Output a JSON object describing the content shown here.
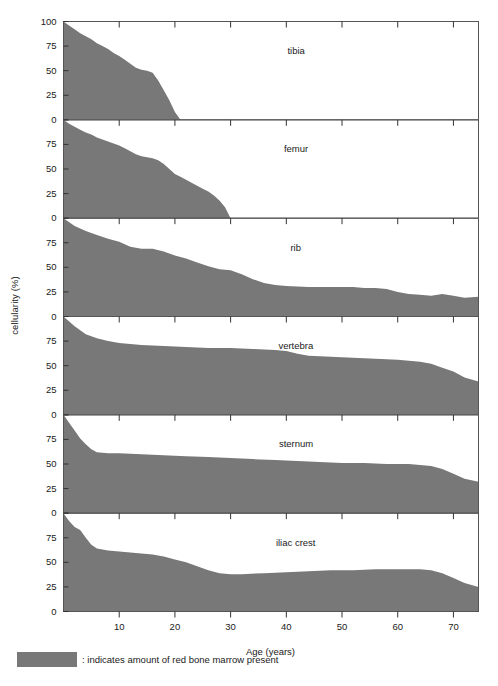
{
  "chart_data": {
    "type": "area",
    "title": "",
    "xlabel": "Age (years)",
    "ylabel": "cellularity (%)",
    "xlim": [
      0,
      74.5
    ],
    "ylim": [
      0,
      100
    ],
    "grid": false,
    "legend_position": "below-axes",
    "legend": [
      {
        "swatch_color": "#787878",
        "text": ": indicates amount of red bone marrow present"
      }
    ],
    "x_ticks": [
      0,
      10,
      20,
      30,
      40,
      50,
      60,
      70
    ],
    "x_tick_labels": [
      "",
      "10",
      "20",
      "30",
      "40",
      "50",
      "60",
      "70"
    ],
    "y_ticks": [
      0,
      25,
      50,
      75,
      100
    ],
    "y_tick_labels_first_panel": [
      "0",
      "25",
      "50",
      "75",
      "100"
    ],
    "y_tick_labels_other_panels": [
      "0",
      "25",
      "50",
      "75",
      ""
    ],
    "fill_color": "#787878",
    "panels": [
      {
        "label": "tibia",
        "x": [
          0,
          1,
          2,
          3,
          4,
          5,
          6,
          7,
          8,
          9,
          10,
          11,
          12,
          13,
          14,
          15,
          16,
          17,
          18,
          19,
          20,
          21,
          74.5
        ],
        "y": [
          100,
          96,
          92,
          88,
          85,
          82,
          78,
          75,
          72,
          68,
          65,
          61,
          57,
          53,
          51,
          50,
          48,
          40,
          30,
          20,
          8,
          0,
          0
        ]
      },
      {
        "label": "femur",
        "x": [
          0,
          1,
          2,
          3,
          4,
          5,
          6,
          7,
          8,
          9,
          10,
          11,
          12,
          13,
          14,
          15,
          16,
          17,
          18,
          19,
          20,
          21,
          22,
          23,
          24,
          25,
          26,
          27,
          28,
          29,
          30,
          74.5
        ],
        "y": [
          100,
          96,
          93,
          90,
          87,
          85,
          82,
          80,
          78,
          76,
          74,
          71,
          68,
          65,
          63,
          62,
          61,
          59,
          55,
          50,
          45,
          42,
          39,
          36,
          33,
          30,
          27,
          23,
          18,
          11,
          0,
          0
        ]
      },
      {
        "label": "rib",
        "x": [
          0,
          2,
          4,
          6,
          8,
          10,
          12,
          14,
          16,
          18,
          20,
          22,
          24,
          26,
          28,
          30,
          32,
          34,
          36,
          38,
          40,
          44,
          48,
          50,
          52,
          54,
          56,
          58,
          60,
          62,
          64,
          66,
          68,
          70,
          72,
          74.5
        ],
        "y": [
          100,
          92,
          87,
          83,
          79,
          76,
          71,
          69,
          69,
          66,
          62,
          59,
          55,
          51,
          48,
          47,
          43,
          38,
          34,
          32,
          31,
          30,
          30,
          30,
          30,
          29,
          29,
          28,
          25,
          23,
          22,
          21,
          23,
          21,
          19,
          20
        ]
      },
      {
        "label": "vertebra",
        "x": [
          0,
          2,
          4,
          6,
          8,
          10,
          14,
          18,
          22,
          26,
          30,
          34,
          38,
          40,
          42,
          44,
          48,
          52,
          56,
          60,
          62,
          64,
          66,
          68,
          70,
          72,
          74.5
        ],
        "y": [
          100,
          90,
          82,
          78,
          75,
          73,
          71,
          70,
          69,
          68,
          68,
          67,
          66,
          65,
          62,
          60,
          59,
          58,
          57,
          56,
          55,
          54,
          52,
          48,
          44,
          38,
          34
        ]
      },
      {
        "label": "sternum",
        "x": [
          0,
          1,
          2,
          3,
          4,
          5,
          6,
          8,
          10,
          14,
          18,
          22,
          26,
          30,
          34,
          38,
          42,
          46,
          50,
          54,
          58,
          60,
          62,
          64,
          66,
          68,
          70,
          72,
          74.5
        ],
        "y": [
          100,
          92,
          84,
          76,
          70,
          65,
          62,
          61,
          61,
          60,
          59,
          58,
          57,
          56,
          55,
          54,
          53,
          52,
          51,
          51,
          50,
          50,
          50,
          49,
          48,
          45,
          40,
          35,
          32
        ]
      },
      {
        "label": "iliac crest",
        "x": [
          0,
          1,
          2,
          3,
          4,
          5,
          6,
          8,
          10,
          12,
          14,
          16,
          18,
          20,
          22,
          24,
          26,
          28,
          30,
          32,
          36,
          40,
          44,
          48,
          52,
          56,
          60,
          62,
          64,
          66,
          68,
          70,
          72,
          74.5
        ],
        "y": [
          100,
          92,
          86,
          83,
          75,
          68,
          64,
          62,
          61,
          60,
          59,
          58,
          56,
          53,
          50,
          46,
          42,
          39,
          38,
          38,
          39,
          40,
          41,
          42,
          42,
          43,
          43,
          43,
          43,
          42,
          39,
          34,
          29,
          25
        ]
      }
    ]
  }
}
